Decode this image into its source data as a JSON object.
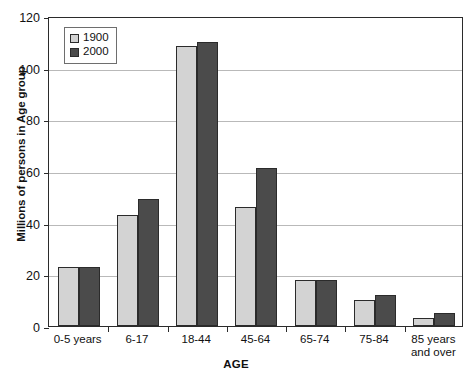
{
  "chart_data": {
    "type": "bar",
    "title": "",
    "xlabel": "AGE",
    "ylabel": "Millions of persons in Age group",
    "categories": [
      "0-5 years",
      "6-17",
      "18-44",
      "45-64",
      "65-74",
      "75-84",
      "85 years and over"
    ],
    "series": [
      {
        "name": "1900",
        "values": [
          23,
          43,
          108.5,
          46,
          18,
          10,
          3
        ],
        "color": "#d3d3d3"
      },
      {
        "name": "2000",
        "values": [
          23,
          49,
          110,
          61,
          18,
          12,
          5
        ],
        "color": "#4b4b4b"
      }
    ],
    "ylim": [
      0,
      120
    ],
    "yticks": [
      0,
      20,
      40,
      60,
      80,
      100,
      120
    ],
    "ytick_labels": [
      "0",
      "20",
      "40",
      "60",
      "80",
      "100",
      "120"
    ],
    "grid": true,
    "legend_position": "top-left"
  },
  "legend": {
    "entries": [
      {
        "label": "1900"
      },
      {
        "label": "2000"
      }
    ]
  },
  "colors": {
    "series_1900": "#d3d3d3",
    "series_2000": "#4b4b4b",
    "axis": "#2b2b2b",
    "grid": "#b9b9b9",
    "background": "#ffffff"
  }
}
